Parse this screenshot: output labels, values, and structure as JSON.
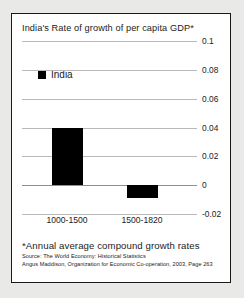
{
  "chart_data": {
    "type": "bar",
    "title": "India's Rate of growth of per capita GDP*",
    "xlabel": "",
    "ylabel": "",
    "categories": [
      "1000-1500",
      "1500-1820"
    ],
    "series": [
      {
        "name": "India",
        "values": [
          0.04,
          -0.009
        ]
      }
    ],
    "ylim": [
      -0.02,
      0.1
    ],
    "yticks": [
      0.1,
      0.08,
      0.06,
      0.04,
      0.02,
      0,
      -0.02
    ],
    "ytick_labels": [
      "0.1",
      "0.08",
      "0.06",
      "0.04",
      "0.02",
      "0",
      "-0.02"
    ],
    "grid": true,
    "legend": {
      "position": "top-left",
      "entries": [
        {
          "label": "India",
          "color": "#000000"
        }
      ]
    },
    "annotations": {
      "footnote": "*Annual average compound growth rates",
      "source_line_1": "Source: The World Economy: Historical Statistics",
      "source_line_2": "Angus Maddison, Organization for Economic Co-operation, 2003, Page 263"
    }
  },
  "colors": {
    "bar": "#000000",
    "grid": "#b9b9b9",
    "zero_line": "#8f8f8f",
    "border": "#1a1a1a",
    "text": "#1b1b1b",
    "page_background": "#e9e9e7",
    "figure_background": "#ffffff"
  }
}
